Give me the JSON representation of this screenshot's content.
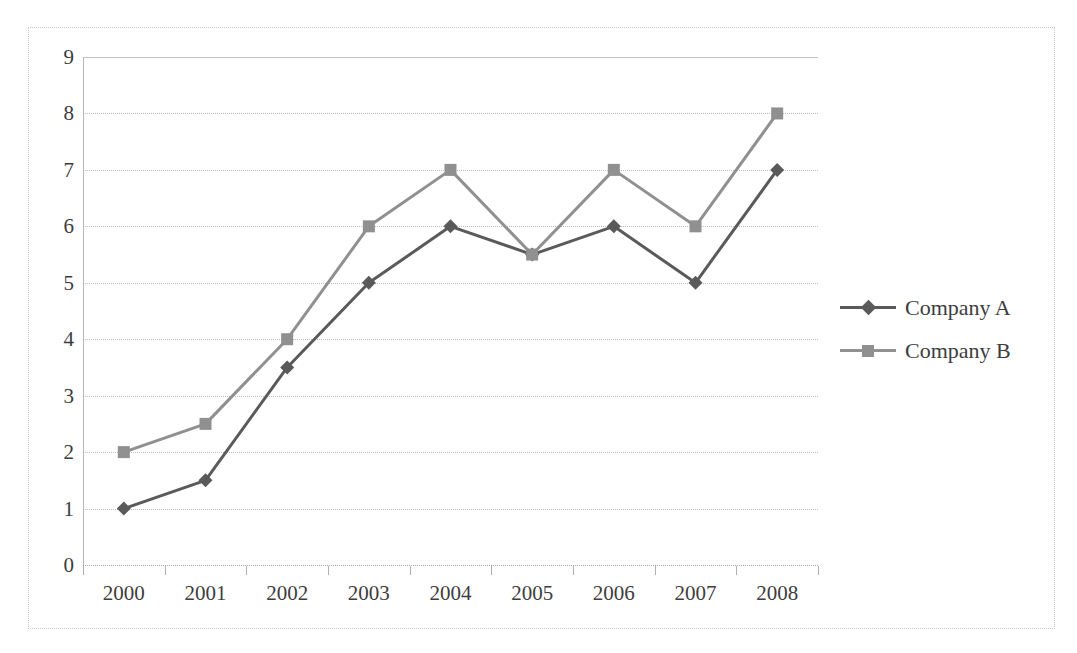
{
  "chart_data": {
    "type": "line",
    "title": "",
    "subtitle": "",
    "xlabel": "",
    "ylabel": "",
    "categories": [
      "2000",
      "2001",
      "2002",
      "2003",
      "2004",
      "2005",
      "2006",
      "2007",
      "2008"
    ],
    "series": [
      {
        "name": "Company A",
        "color": "#5a5a5a",
        "marker": "diamond",
        "values": [
          1,
          1.5,
          3.5,
          5,
          6,
          5.5,
          6,
          5,
          7
        ]
      },
      {
        "name": "Company B",
        "color": "#909090",
        "marker": "square",
        "values": [
          2,
          2.5,
          4,
          6,
          7,
          5.5,
          7,
          6,
          8
        ]
      }
    ],
    "ylim": [
      0,
      9
    ],
    "xlim_categories": 9,
    "y_ticks": [
      0,
      1,
      2,
      3,
      4,
      5,
      6,
      7,
      8,
      9
    ],
    "y_tick_labels": [
      "0",
      "1",
      "2",
      "3",
      "4",
      "5",
      "6",
      "7",
      "8",
      "9"
    ],
    "grid": {
      "horizontal": true,
      "vertical": false,
      "style": "dotted",
      "color": "#bdbdbd"
    },
    "legend": {
      "position": "right",
      "entries": [
        "Company A",
        "Company B"
      ]
    },
    "plot_border": {
      "color": "#c8c8c8",
      "style": "dotted"
    },
    "axis_line_color": "#b5b5b5"
  }
}
